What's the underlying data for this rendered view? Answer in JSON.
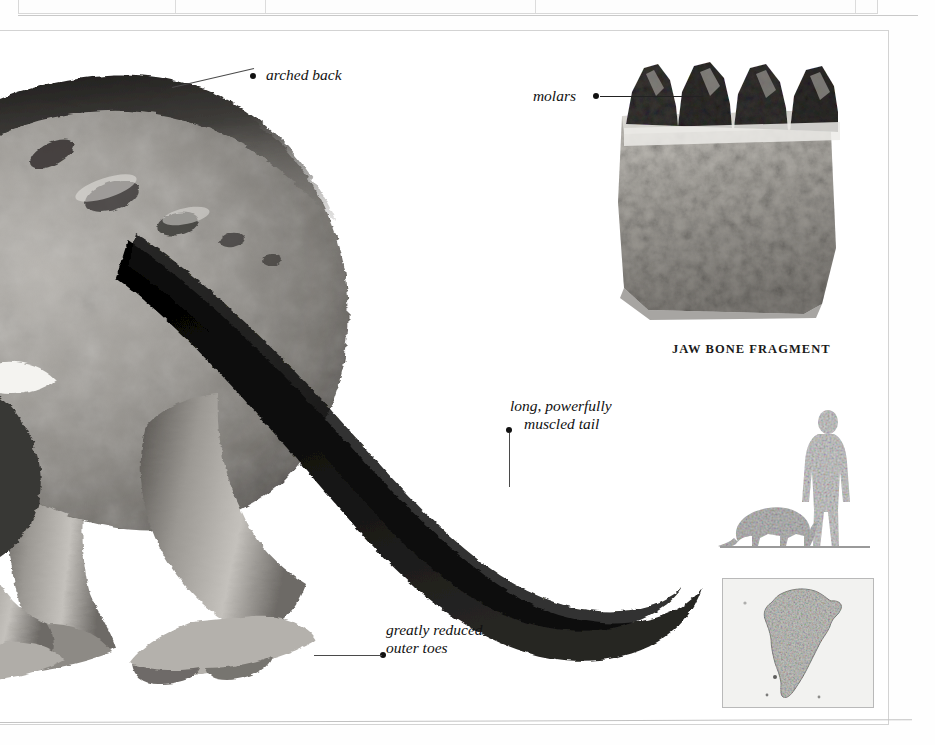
{
  "page": {
    "background_color": "#ffffff",
    "frame_color": "#d3d3d3",
    "ink_color": "#111111"
  },
  "table_fragment": {
    "visible_cell_text": "(cut off)",
    "note": "bottom edge of a data table cropped at the top of the page"
  },
  "plate": {
    "type": "natural-history illustration plate",
    "subject": "prehistoric mammal, hind quarters and tail"
  },
  "callouts": [
    {
      "id": "arched-back",
      "text": "arched back",
      "lines": [
        "arched back"
      ],
      "dot_side": "left",
      "dot": {
        "x": 255,
        "y": 77
      },
      "text_pos": {
        "x": 266,
        "y": 67
      },
      "leader": {
        "x1": 170,
        "y1": 57,
        "x2": 253,
        "y2": 77
      }
    },
    {
      "id": "molars",
      "text": "molars",
      "lines": [
        "molars"
      ],
      "dot_side": "right",
      "dot": {
        "x": 597,
        "y": 96
      },
      "text_pos": {
        "x": 536,
        "y": 87
      },
      "leader": {
        "x1": 603,
        "y1": 99,
        "x2": 700,
        "y2": 99
      }
    },
    {
      "id": "muscled-tail",
      "text": "long, powerfully muscled tail",
      "lines": [
        "long, powerfully",
        "muscled tail"
      ],
      "dot_side": "left",
      "dot": {
        "x": 509,
        "y": 430
      },
      "text_pos": {
        "x": 512,
        "y": 398
      },
      "leader": {
        "x1": 512,
        "y1": 436,
        "x2": 512,
        "y2": 486
      }
    },
    {
      "id": "outer-toes",
      "text": "greatly reduced outer toes",
      "lines": [
        "greatly reduced",
        "outer toes"
      ],
      "dot_side": "left",
      "dot": {
        "x": 383,
        "y": 655
      },
      "text_pos": {
        "x": 386,
        "y": 622
      },
      "leader": {
        "x1": 316,
        "y1": 655,
        "x2": 381,
        "y2": 655
      }
    }
  ],
  "fossil": {
    "caption": "JAW BONE FRAGMENT",
    "caption_pos": {
      "x": 672,
      "y": 343
    },
    "tooth_count": 4,
    "tooth_color": "#3b3a38",
    "bone_color": "#a9a7a2"
  },
  "scale_comparison": {
    "human_label": "human silhouette",
    "animal_label": "animal silhouette",
    "silhouette_color": "#cfcfcf",
    "ground_color": "#9a9a9a"
  },
  "distribution_map": {
    "region": "South America",
    "land_color": "#c6c6c2",
    "sea_color": "#f2f2f0",
    "border_color": "#b9b9b9"
  }
}
